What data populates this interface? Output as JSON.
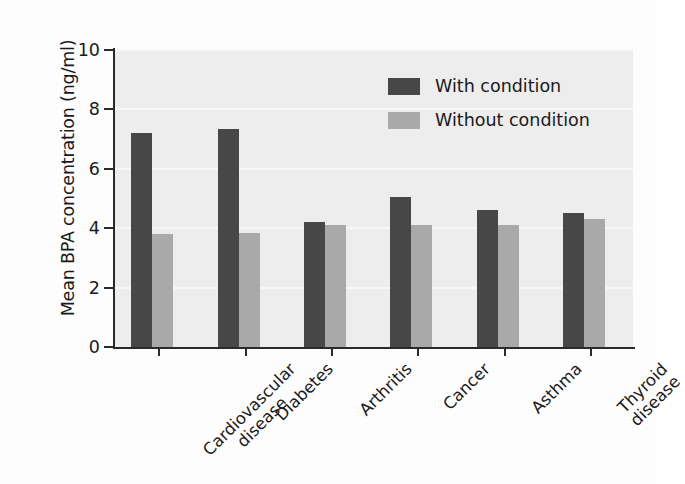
{
  "chart_data": {
    "type": "bar",
    "title": "",
    "subtitle": "",
    "xlabel": "",
    "ylabel": "Mean BPA concentration (ng/ml)",
    "categories": [
      "Cardiovascular disease",
      "Diabetes",
      "Arthritis",
      "Cancer",
      "Asthma",
      "Thyroid disease"
    ],
    "category_lines": [
      [
        "Cardiovascular",
        "disease"
      ],
      [
        "Diabetes"
      ],
      [
        "Arthritis"
      ],
      [
        "Cancer"
      ],
      [
        "Asthma"
      ],
      [
        "Thyroid",
        "disease"
      ]
    ],
    "series": [
      {
        "name": "With condition",
        "color": "#474747",
        "values": [
          7.2,
          7.35,
          4.2,
          5.05,
          4.6,
          4.5
        ]
      },
      {
        "name": "Without condition",
        "color": "#a9a9a9",
        "values": [
          3.8,
          3.85,
          4.1,
          4.1,
          4.1,
          4.3
        ]
      }
    ],
    "ylim": [
      0,
      10
    ],
    "yticks": [
      0,
      2,
      4,
      6,
      8,
      10
    ],
    "ytick_labels": [
      "0",
      "2",
      "4",
      "6",
      "8",
      "10"
    ],
    "grid": true,
    "grid_color": "#f7f7f7",
    "legend_position": "upper right",
    "plot_background": "#ededed",
    "figure_background": "#fdfdfd",
    "axis_color": "#2a2a2a"
  }
}
